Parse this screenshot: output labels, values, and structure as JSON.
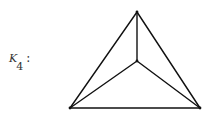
{
  "label": {
    "letter": "K",
    "subscript": "4",
    "colon": ":"
  },
  "graph": {
    "name": "K4 complete graph",
    "vertices": [
      {
        "id": "top",
        "x": 137,
        "y": 12
      },
      {
        "id": "center",
        "x": 137,
        "y": 61
      },
      {
        "id": "bottom-left",
        "x": 70,
        "y": 108
      },
      {
        "id": "bottom-right",
        "x": 200,
        "y": 108
      }
    ],
    "edges": [
      [
        "top",
        "bottom-left"
      ],
      [
        "top",
        "bottom-right"
      ],
      [
        "bottom-left",
        "bottom-right"
      ],
      [
        "top",
        "center"
      ],
      [
        "center",
        "bottom-left"
      ],
      [
        "center",
        "bottom-right"
      ]
    ],
    "stroke_color": "#111111"
  }
}
